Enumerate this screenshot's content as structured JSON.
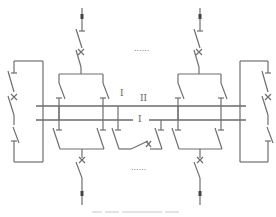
{
  "diagram": {
    "type": "electrical-single-line-diagram",
    "bus_labels": {
      "bus_1_upper_left": "I",
      "bus_2": "II",
      "bus_1_lower": "I"
    },
    "ellipsis_top": "......",
    "ellipsis_bottom": "......",
    "colors": {
      "line": "#6f6f6f",
      "background": "#ffffff"
    }
  }
}
